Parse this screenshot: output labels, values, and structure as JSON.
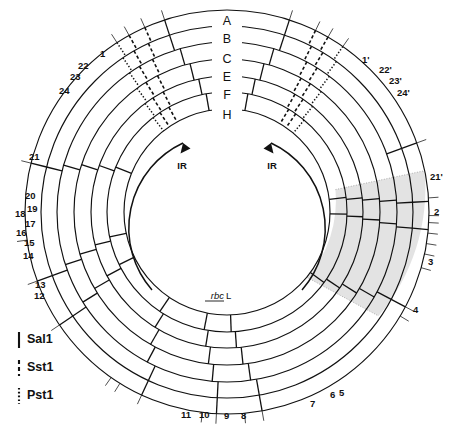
{
  "figure": {
    "center": {
      "x": 227,
      "y": 212
    },
    "rings": [
      {
        "id": "A",
        "label": "A",
        "r_outer": 202,
        "r_inner": 186
      },
      {
        "id": "B",
        "label": "B",
        "r_outer": 186,
        "r_inner": 170
      },
      {
        "id": "C",
        "label": "C",
        "r_outer": 170,
        "r_inner": 153
      },
      {
        "id": "E",
        "label": "E",
        "r_outer": 153,
        "r_inner": 136
      },
      {
        "id": "F",
        "label": "F",
        "r_outer": 136,
        "r_inner": 120
      },
      {
        "id": "H",
        "label": "H",
        "r_outer": 120,
        "r_inner": 103
      }
    ],
    "legend": {
      "title": "",
      "items": [
        {
          "label": "Sal1",
          "style": "solid",
          "name": "sal1"
        },
        {
          "label": "Sst1",
          "style": "dashed",
          "name": "sst1"
        },
        {
          "label": "Pst1",
          "style": "dotted",
          "name": "pst1"
        }
      ]
    },
    "inverted_repeats": [
      {
        "label": "IR",
        "side": "left"
      },
      {
        "label": "IR",
        "side": "right"
      }
    ],
    "gene_markers": [
      {
        "label": "rbcL",
        "italic_part": "rbc",
        "roman_part": "L",
        "angle_deg": 268
      }
    ],
    "shaded_sector": {
      "start_deg": 12,
      "end_deg": 40,
      "color": "#d9d9d9",
      "description": "single-copy region highlight"
    },
    "position_labels": [
      {
        "text": "1",
        "angle_deg": 288,
        "x": 100,
        "y": 57
      },
      {
        "text": "22",
        "angle_deg": 296,
        "x": 78,
        "y": 69
      },
      {
        "text": "23",
        "angle_deg": 300,
        "x": 70,
        "y": 80
      },
      {
        "text": "24",
        "angle_deg": 305,
        "x": 59,
        "y": 94
      },
      {
        "text": "21",
        "angle_deg": 340,
        "x": 29,
        "y": 160
      },
      {
        "text": "20",
        "angle_deg": 356,
        "x": 25,
        "y": 199
      },
      {
        "text": "19",
        "angle_deg": 1,
        "x": 27,
        "y": 212
      },
      {
        "text": "18",
        "angle_deg": 3,
        "x": 15,
        "y": 217
      },
      {
        "text": "17",
        "angle_deg": 6,
        "x": 25,
        "y": 227
      },
      {
        "text": "16",
        "angle_deg": 9,
        "x": 16,
        "y": 236
      },
      {
        "text": "15",
        "angle_deg": 12,
        "x": 24,
        "y": 246
      },
      {
        "text": "14",
        "angle_deg": 16,
        "x": 23,
        "y": 259
      },
      {
        "text": "13",
        "angle_deg": 28,
        "x": 35,
        "y": 288
      },
      {
        "text": "12",
        "angle_deg": 31,
        "x": 34,
        "y": 299
      },
      {
        "text": "11",
        "angle_deg": 80,
        "x": 181,
        "y": 418
      },
      {
        "text": "10",
        "angle_deg": 85,
        "x": 199,
        "y": 418
      },
      {
        "text": "9",
        "angle_deg": 93,
        "x": 224,
        "y": 419
      },
      {
        "text": "8",
        "angle_deg": 97,
        "x": 241,
        "y": 419
      },
      {
        "text": "7",
        "angle_deg": 115,
        "x": 310,
        "y": 407
      },
      {
        "text": "6",
        "angle_deg": 122,
        "x": 330,
        "y": 398
      },
      {
        "text": "5",
        "angle_deg": 125,
        "x": 339,
        "y": 396
      },
      {
        "text": "4",
        "angle_deg": 146,
        "x": 413,
        "y": 313
      },
      {
        "text": "3",
        "angle_deg": 160,
        "x": 428,
        "y": 265
      },
      {
        "text": "2",
        "angle_deg": 172,
        "x": 434,
        "y": 215
      },
      {
        "text": "21'",
        "angle_deg": 194,
        "x": 430,
        "y": 180
      },
      {
        "text": "24'",
        "angle_deg": 237,
        "x": 397,
        "y": 96
      },
      {
        "text": "23'",
        "angle_deg": 241,
        "x": 389,
        "y": 84
      },
      {
        "text": "22'",
        "angle_deg": 246,
        "x": 379,
        "y": 73
      },
      {
        "text": "1'",
        "angle_deg": 252,
        "x": 362,
        "y": 63
      }
    ],
    "restriction_sites": {
      "sal1_label": "Sal1",
      "sst1_label": "Sst1",
      "pst1_label": "Pst1",
      "ring_A": {
        "sal1_deg": [
          288,
          340,
          357,
          5,
          28,
          80,
          93,
          115,
          146,
          160,
          194,
          252
        ],
        "sst1_deg": [
          296,
          300,
          246,
          241
        ],
        "pst1_deg": [
          305,
          237
        ]
      },
      "ring_B": {
        "sal1_deg": [
          288,
          340,
          357,
          5,
          28,
          80,
          93,
          115,
          146,
          160,
          194,
          252
        ],
        "sst1_deg": [
          297,
          301,
          245,
          240
        ],
        "pst1_deg": [
          306,
          236
        ]
      },
      "ring_C": {
        "sal1_deg": [
          286,
          356,
          4,
          30,
          82,
          95,
          118,
          148,
          162,
          196,
          254
        ],
        "sst1_deg": [
          298,
          302,
          244,
          239
        ],
        "pst1_deg": [
          307,
          235
        ]
      },
      "ring_E": {
        "sal1_deg": [
          284,
          355,
          3,
          32,
          84,
          97,
          120,
          150,
          164,
          198,
          256
        ],
        "sst1_deg": [
          299,
          303,
          243,
          238
        ],
        "pst1_deg": [
          308,
          234
        ]
      },
      "ring_F": {
        "sal1_deg": [
          282,
          354,
          2,
          34,
          86,
          99,
          122,
          152,
          166,
          200,
          258
        ],
        "sst1_deg": [
          300,
          304,
          242,
          237
        ],
        "pst1_deg": [
          309,
          233
        ]
      },
      "ring_H": {
        "sal1_deg": [
          280,
          353,
          1,
          36,
          88,
          101,
          124,
          154,
          168,
          202,
          260
        ],
        "sst1_deg": [
          301,
          305,
          241,
          236
        ],
        "pst1_deg": [
          310,
          232
        ]
      }
    }
  }
}
